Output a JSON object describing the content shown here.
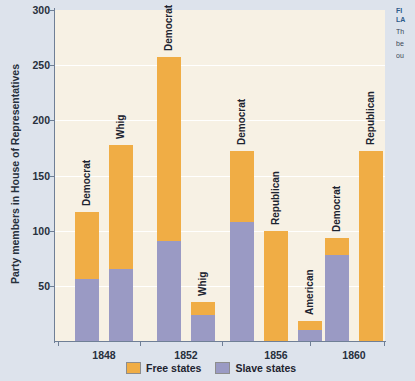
{
  "chart_data": {
    "type": "bar",
    "subtype": "stacked-grouped-bar",
    "title": "",
    "xlabel": "",
    "ylabel": "Party members in House of Representatives",
    "ylim": [
      0,
      300
    ],
    "yticks": [
      50,
      100,
      150,
      200,
      250,
      300
    ],
    "ytick_labels": [
      "50",
      "100",
      "150",
      "200",
      "250",
      "300"
    ],
    "grid": true,
    "grid_axis": "y",
    "legend_position": "bottom",
    "categories": [
      "1848",
      "1852",
      "1856",
      "1860"
    ],
    "series": [
      {
        "name": "Free states",
        "color": "#f0ad45"
      },
      {
        "name": "Slave states",
        "color": "#9a9ac4"
      }
    ],
    "groups": [
      {
        "category": "1848",
        "bars": [
          {
            "party": "Democrat",
            "slave_states": 56,
            "free_states": 61,
            "total": 117
          },
          {
            "party": "Whig",
            "slave_states": 65,
            "free_states": 113,
            "total": 178
          }
        ]
      },
      {
        "category": "1852",
        "bars": [
          {
            "party": "Democrat",
            "slave_states": 91,
            "free_states": 166,
            "total": 257
          },
          {
            "party": "Whig",
            "slave_states": 24,
            "free_states": 11,
            "total": 35
          }
        ]
      },
      {
        "category": "1856",
        "bars": [
          {
            "party": "Democrat",
            "slave_states": 108,
            "free_states": 64,
            "total": 172
          },
          {
            "party": "Republican",
            "slave_states": 0,
            "free_states": 100,
            "total": 100
          },
          {
            "party": "American",
            "slave_states": 10,
            "free_states": 8,
            "total": 18
          }
        ]
      },
      {
        "category": "1860",
        "bars": [
          {
            "party": "Democrat",
            "slave_states": 78,
            "free_states": 15,
            "total": 93
          },
          {
            "party": "Republican",
            "slave_states": 0,
            "free_states": 172,
            "total": 172
          }
        ]
      }
    ]
  },
  "legend": {
    "items": [
      {
        "label": "Free states",
        "color": "#f0ad45"
      },
      {
        "label": "Slave states",
        "color": "#9a9ac4"
      }
    ]
  },
  "caption": {
    "title_fragment": "FI",
    "subtitle_fragment": "LA",
    "body_fragment_1": "Th",
    "body_fragment_2": "be",
    "body_fragment_3": "ou"
  },
  "colors": {
    "free_states": "#f0ad45",
    "slave_states": "#9a9ac4",
    "plot_background": "#f7f1e4",
    "page_background": "#dde3ec",
    "axis": "#6f7f96",
    "gridline": "#ffffff",
    "text": "#27303c"
  }
}
